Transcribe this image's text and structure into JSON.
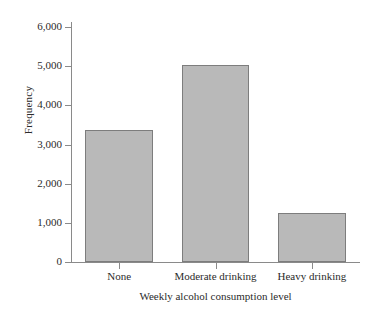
{
  "chart_data": {
    "type": "bar",
    "title": "",
    "subtitle": "",
    "categories": [
      "None",
      "Moderate drinking",
      "Heavy drinking"
    ],
    "values": [
      3370,
      5040,
      1240
    ],
    "xlabel": "Weekly alcohol consumption level",
    "ylabel": "Frequency",
    "ylim": [
      0,
      6000
    ],
    "ytick_labels": [
      "6,000",
      "5,000",
      "4,000",
      "3,000",
      "2,000",
      "1,000",
      "0"
    ],
    "ytick_values": [
      6000,
      5000,
      4000,
      3000,
      2000,
      1000,
      0
    ],
    "grid": false,
    "legend": false,
    "legend_position": "none",
    "bar_fill_color": "#b9b9b9",
    "bar_border_color": "#7d7d7d",
    "axis_color": "#8a8a8a",
    "text_color": "#2b2b2b",
    "background_color": "#ffffff"
  }
}
